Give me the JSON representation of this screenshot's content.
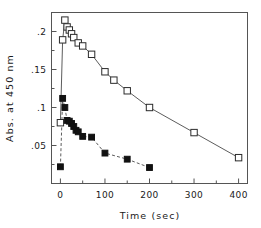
{
  "chart_data": {
    "type": "line",
    "title": "",
    "subtitle": "",
    "xlabel": "Time (sec)",
    "ylabel": "Abs. at 450 nm",
    "xlim": [
      -20,
      420
    ],
    "ylim": [
      0,
      0.225
    ],
    "grid": false,
    "legend": "none",
    "x_ticks": [
      0,
      100,
      200,
      300,
      400
    ],
    "x_tick_labels": [
      "0",
      "100",
      "200",
      "300",
      "400"
    ],
    "x_minor_ticks": [
      50,
      150,
      250,
      350
    ],
    "y_ticks": [
      0.05,
      0.1,
      0.15,
      0.2
    ],
    "y_tick_labels": [
      ".05",
      ".1",
      ".15",
      ".2"
    ],
    "y_minor_ticks": [
      0.025,
      0.075,
      0.125,
      0.175,
      0.225
    ],
    "series": [
      {
        "name": "open-squares",
        "marker": "open-square",
        "linestyle": "solid",
        "x": [
          0,
          5,
          10,
          15,
          20,
          25,
          30,
          40,
          50,
          70,
          100,
          120,
          150,
          200,
          300,
          400
        ],
        "y": [
          0.08,
          0.189,
          0.215,
          0.206,
          0.202,
          0.197,
          0.192,
          0.185,
          0.181,
          0.17,
          0.147,
          0.136,
          0.122,
          0.1,
          0.067,
          0.034
        ]
      },
      {
        "name": "closed-squares",
        "marker": "closed-square",
        "linestyle": "dashed",
        "x": [
          0,
          5,
          10,
          15,
          20,
          25,
          30,
          35,
          40,
          50,
          70,
          100,
          150,
          200
        ],
        "y": [
          0.022,
          0.112,
          0.1,
          0.083,
          0.082,
          0.079,
          0.075,
          0.07,
          0.068,
          0.062,
          0.061,
          0.04,
          0.032,
          0.021
        ]
      }
    ]
  }
}
